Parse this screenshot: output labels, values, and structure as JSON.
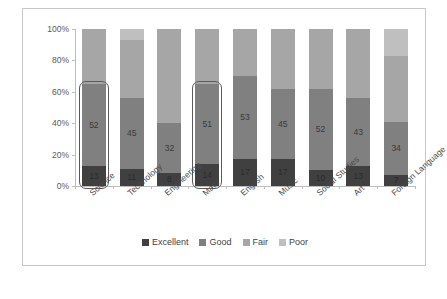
{
  "chart_data": {
    "type": "bar",
    "subtype": "100% stacked column",
    "title": "",
    "xlabel": "",
    "ylabel": "",
    "ylim": [
      0,
      100
    ],
    "ytick_labels": [
      "0%",
      "20%",
      "40%",
      "60%",
      "80%",
      "100%"
    ],
    "ytick_values": [
      0,
      20,
      40,
      60,
      80,
      100
    ],
    "grid": false,
    "legend_position": "bottom",
    "categories": [
      "Science",
      "Technology",
      "Engineering",
      "Math",
      "English",
      "Music",
      "Social Studies",
      "Art",
      "Foreign Language"
    ],
    "series": [
      {
        "name": "Excellent",
        "color": "#404040",
        "values": [
          13,
          11,
          8,
          14,
          17,
          17,
          10,
          13,
          7
        ],
        "labels": [
          "13",
          "11",
          "8",
          "14",
          "17",
          "17",
          "10",
          "13",
          "7"
        ]
      },
      {
        "name": "Good",
        "color": "#808080",
        "values": [
          52,
          45,
          32,
          51,
          53,
          45,
          52,
          43,
          34
        ],
        "labels": [
          "52",
          "45",
          "32",
          "51",
          "53",
          "45",
          "52",
          "43",
          "34"
        ]
      },
      {
        "name": "Fair",
        "color": "#a6a6a6",
        "values": [
          35,
          37,
          60,
          35,
          30,
          38,
          38,
          44,
          42
        ],
        "labels": [
          "",
          "",
          "",
          "",
          "",
          "",
          "",
          "",
          ""
        ]
      },
      {
        "name": "Poor",
        "color": "#bfbfbf",
        "values": [
          0,
          7,
          0,
          0,
          0,
          0,
          0,
          0,
          17
        ],
        "labels": [
          "",
          "",
          "",
          "",
          "",
          "",
          "",
          "",
          ""
        ]
      }
    ],
    "highlighted_categories": [
      "Science",
      "Math"
    ],
    "highlight_color": "#5a5a5a"
  },
  "legend": {
    "items": [
      {
        "label": "Excellent",
        "color": "#404040"
      },
      {
        "label": "Good",
        "color": "#808080"
      },
      {
        "label": "Fair",
        "color": "#a6a6a6"
      },
      {
        "label": "Poor",
        "color": "#bfbfbf"
      }
    ]
  }
}
